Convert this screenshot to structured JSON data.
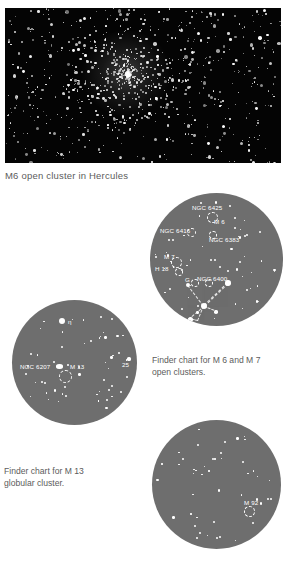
{
  "page": {
    "background_color": "#ffffff",
    "text_color": "#5c5c5c"
  },
  "photo": {
    "name": "cluster-photograph",
    "caption": "M6 open cluster in Hercules",
    "background_color": "#040404",
    "star_color": "#ffffff"
  },
  "charts": [
    {
      "id": "chart-m6m7",
      "caption": "Finder chart for M 6 and M 7\nopen clusters.",
      "sky_color": "#6e6e6e",
      "labels": [
        {
          "text": "NGC 6425",
          "x": 42,
          "y": 12
        },
        {
          "text": "M 6",
          "x": 64,
          "y": 26
        },
        {
          "text": "NGC 6416",
          "x": 10,
          "y": 35
        },
        {
          "text": "NGC 6383",
          "x": 59,
          "y": 44
        },
        {
          "text": "M 7",
          "x": 14,
          "y": 61
        },
        {
          "text": "H 18",
          "x": 5,
          "y": 73
        },
        {
          "text": "G",
          "x": 35,
          "y": 84
        },
        {
          "text": "NGC 6400",
          "x": 47,
          "y": 83
        }
      ]
    },
    {
      "id": "chart-m13",
      "caption": "Finder chart for M 13\nglobular cluster.",
      "sky_color": "#6e6e6e",
      "labels": [
        {
          "text": "η",
          "x": 56,
          "y": 19
        },
        {
          "text": "NGC 6207",
          "x": 8,
          "y": 64
        },
        {
          "text": "M 13",
          "x": 58,
          "y": 64
        },
        {
          "text": "25",
          "x": 110,
          "y": 62
        }
      ]
    },
    {
      "id": "chart-m92",
      "caption": "",
      "sky_color": "#6e6e6e",
      "labels": [
        {
          "text": "M 92",
          "x": 92,
          "y": 80
        }
      ]
    }
  ]
}
